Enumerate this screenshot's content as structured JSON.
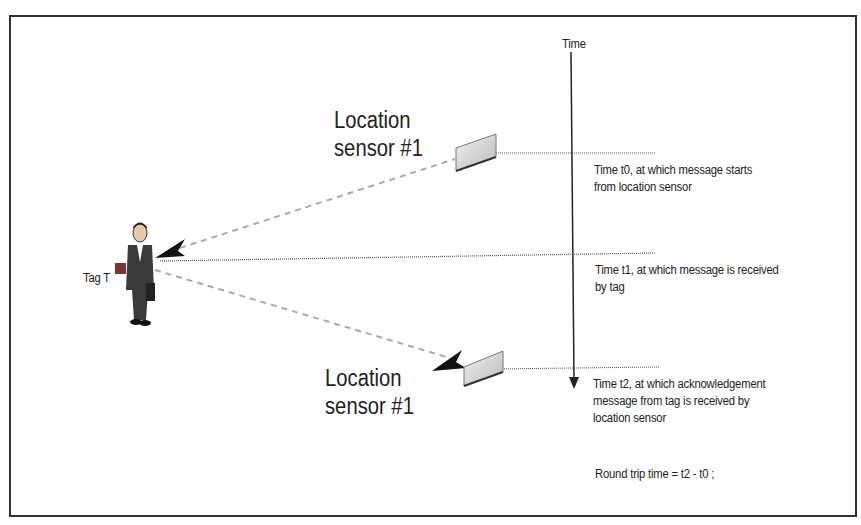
{
  "diagram": {
    "time_axis_label": "Time",
    "sensor_top_label_line1": "Location",
    "sensor_top_label_line2": "sensor #1",
    "sensor_bottom_label_line1": "Location",
    "sensor_bottom_label_line2": "sensor #1",
    "tag_label": "Tag T",
    "events": [
      {
        "time": "t0",
        "line1": "Time t0, at which message starts",
        "line2": "from location sensor"
      },
      {
        "time": "t1",
        "line1": "Time t1, at which message is received",
        "line2": "by tag"
      },
      {
        "time": "t2",
        "line1": "Time t2, at which acknowledgement",
        "line2": "message from tag is received by",
        "line3": "location sensor"
      }
    ],
    "formula": "Round trip time  = t2 - t0 ;"
  },
  "colors": {
    "line": "#333333",
    "dashed": "#aaaaaa",
    "tag_square": "#8a3b3b",
    "sensor_fill": "#d0d0d0"
  }
}
